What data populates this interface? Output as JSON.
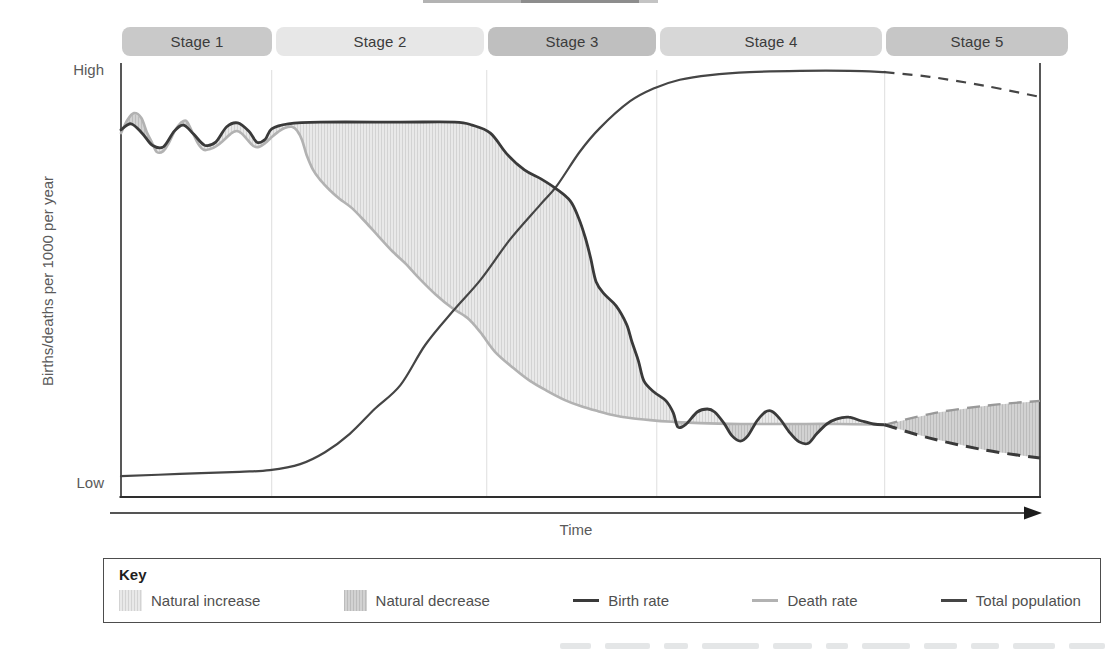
{
  "axes": {
    "y_title": "Births/deaths per 1000 per year",
    "y_high": "High",
    "y_low": "Low",
    "x_title": "Time"
  },
  "key": {
    "title": "Key",
    "items": [
      {
        "label": "Natural increase",
        "swatch": "increase"
      },
      {
        "label": "Natural decrease",
        "swatch": "decrease"
      },
      {
        "label": "Birth rate",
        "swatch": "line",
        "color": "#3a3a3a"
      },
      {
        "label": "Death rate",
        "swatch": "line",
        "color": "#b2b2b2"
      },
      {
        "label": "Total population",
        "swatch": "line",
        "color": "#454545"
      }
    ]
  },
  "colors": {
    "birth": "#3a3a3a",
    "death": "#b2b2b2",
    "death_projected": "#999999",
    "population": "#454545",
    "increase_fill": "#e9e9e9",
    "increase_line": "#d3d3d3",
    "decrease_fill": "#d2d2d2",
    "decrease_line": "#bcbcbc",
    "axis": "#2e2e2e",
    "divider": "#dedede",
    "arrow": "#1c1c1c"
  },
  "chart_data": {
    "type": "line",
    "xlabel": "Time",
    "ylabel": "Births/deaths per 1000 per year",
    "x_range": [
      0,
      100
    ],
    "y_range": [
      0,
      100
    ],
    "y_tick_labels": [
      "Low",
      "High"
    ],
    "grid": false,
    "legend_position": "bottom-box",
    "stages": [
      {
        "label": "Stage 1",
        "t0": 0.1,
        "t1": 16.4,
        "color": "#c9c9c9"
      },
      {
        "label": "Stage 2",
        "t0": 16.9,
        "t1": 39.5,
        "color": "#e7e7e7"
      },
      {
        "label": "Stage 3",
        "t0": 39.9,
        "t1": 58.2,
        "color": "#bfbfbf"
      },
      {
        "label": "Stage 4",
        "t0": 58.6,
        "t1": 82.8,
        "color": "#d7d7d7"
      },
      {
        "label": "Stage 5",
        "t0": 83.2,
        "t1": 103.0,
        "color": "#c6c6c6"
      }
    ],
    "stage_boundaries": [
      16.4,
      39.8,
      58.3,
      83.1
    ],
    "series": [
      {
        "name": "Birth rate",
        "style": "solid",
        "points": [
          [
            0,
            86
          ],
          [
            1.1,
            87.4
          ],
          [
            2.3,
            85.2
          ],
          [
            3.4,
            82.4
          ],
          [
            4.6,
            82
          ],
          [
            5.8,
            85.7
          ],
          [
            6.8,
            87.1
          ],
          [
            7.9,
            85
          ],
          [
            9.1,
            82.4
          ],
          [
            10.3,
            83.1
          ],
          [
            11.5,
            86.7
          ],
          [
            12.7,
            87.6
          ],
          [
            13.9,
            85.7
          ],
          [
            14.8,
            83.1
          ],
          [
            15.7,
            83.8
          ],
          [
            16.4,
            86.2
          ],
          [
            18.2,
            87.4
          ],
          [
            21.7,
            87.8
          ],
          [
            30.4,
            87.8
          ],
          [
            36.3,
            87.8
          ],
          [
            38.2,
            87.1
          ],
          [
            40.2,
            85.2
          ],
          [
            42,
            80.3
          ],
          [
            43.9,
            76.6
          ],
          [
            45.7,
            74.5
          ],
          [
            47.4,
            72.1
          ],
          [
            48.9,
            69.3
          ],
          [
            49.8,
            65.3
          ],
          [
            50.5,
            60.9
          ],
          [
            51.1,
            56
          ],
          [
            51.7,
            50.4
          ],
          [
            52.6,
            47.5
          ],
          [
            53.9,
            44.7
          ],
          [
            55,
            40.5
          ],
          [
            55.6,
            36.3
          ],
          [
            56.3,
            31.9
          ],
          [
            56.9,
            27.2
          ],
          [
            58,
            24.6
          ],
          [
            59.3,
            22.5
          ],
          [
            60.1,
            19.7
          ],
          [
            60.6,
            16.4
          ],
          [
            61.5,
            17.1
          ],
          [
            62.7,
            19.9
          ],
          [
            63.8,
            20.6
          ],
          [
            64.6,
            19.9
          ],
          [
            65.6,
            17.3
          ],
          [
            66.5,
            14.3
          ],
          [
            67.4,
            13.1
          ],
          [
            68.2,
            14.3
          ],
          [
            69.2,
            17.8
          ],
          [
            70.1,
            19.9
          ],
          [
            70.8,
            20.1
          ],
          [
            71.7,
            18.3
          ],
          [
            72.8,
            15
          ],
          [
            73.8,
            12.9
          ],
          [
            74.8,
            12.6
          ],
          [
            75.7,
            14.8
          ],
          [
            76.8,
            17.1
          ],
          [
            77.9,
            18.3
          ],
          [
            79.2,
            18.7
          ],
          [
            80.6,
            17.8
          ],
          [
            81.9,
            17.1
          ],
          [
            83.1,
            16.9
          ]
        ]
      },
      {
        "name": "Death rate",
        "style": "solid",
        "points": [
          [
            0,
            85.2
          ],
          [
            0.7,
            88.3
          ],
          [
            1.4,
            89.9
          ],
          [
            2.2,
            88.8
          ],
          [
            2.8,
            85.5
          ],
          [
            3.4,
            82.9
          ],
          [
            3.9,
            80.8
          ],
          [
            4.6,
            81
          ],
          [
            5.2,
            82.9
          ],
          [
            5.9,
            85.9
          ],
          [
            6.5,
            87.6
          ],
          [
            7.1,
            88.1
          ],
          [
            7.7,
            85.7
          ],
          [
            8.4,
            82.7
          ],
          [
            9,
            81.3
          ],
          [
            9.7,
            81.5
          ],
          [
            10.4,
            82.2
          ],
          [
            11.2,
            83.6
          ],
          [
            11.9,
            85
          ],
          [
            12.5,
            85.7
          ],
          [
            13.1,
            85.2
          ],
          [
            13.7,
            83.8
          ],
          [
            14.4,
            82.2
          ],
          [
            15,
            82
          ],
          [
            15.7,
            82.9
          ],
          [
            16.3,
            84.1
          ],
          [
            17.1,
            85.5
          ],
          [
            17.8,
            86.4
          ],
          [
            18.6,
            86.7
          ],
          [
            19.2,
            85.7
          ],
          [
            19.7,
            83.6
          ],
          [
            20.2,
            80.1
          ],
          [
            20.9,
            76.6
          ],
          [
            21.7,
            74.2
          ],
          [
            22.7,
            71.9
          ],
          [
            23.8,
            69.8
          ],
          [
            25.1,
            67.7
          ],
          [
            26.6,
            64.4
          ],
          [
            28,
            61.1
          ],
          [
            29.5,
            57.6
          ],
          [
            30.9,
            54.8
          ],
          [
            32.5,
            51.1
          ],
          [
            34.3,
            47.3
          ],
          [
            36,
            44.3
          ],
          [
            37.7,
            41.9
          ],
          [
            39.1,
            38.6
          ],
          [
            40.7,
            34
          ],
          [
            42.7,
            30.2
          ],
          [
            44.5,
            27.2
          ],
          [
            46.4,
            24.8
          ],
          [
            48.3,
            22.7
          ],
          [
            50,
            21.3
          ],
          [
            51.9,
            20.1
          ],
          [
            53.5,
            19.2
          ],
          [
            55.4,
            18.5
          ],
          [
            57.6,
            18
          ],
          [
            60,
            17.6
          ],
          [
            63,
            17.3
          ],
          [
            67.4,
            17.1
          ],
          [
            72.8,
            17.1
          ],
          [
            78.2,
            17.1
          ],
          [
            83.1,
            16.9
          ]
        ]
      },
      {
        "name": "Total population",
        "style": "solid",
        "points": [
          [
            0,
            4.9
          ],
          [
            6.4,
            5.4
          ],
          [
            12.9,
            5.9
          ],
          [
            16.2,
            6.3
          ],
          [
            19.5,
            7.7
          ],
          [
            22.2,
            10.5
          ],
          [
            24.9,
            14.8
          ],
          [
            27.6,
            20.6
          ],
          [
            30.4,
            26.2
          ],
          [
            33.1,
            35.6
          ],
          [
            36.1,
            43.5
          ],
          [
            39.1,
            50.8
          ],
          [
            42.3,
            60.2
          ],
          [
            45.6,
            68.4
          ],
          [
            47.4,
            72.8
          ],
          [
            49.9,
            80.8
          ],
          [
            52.1,
            86.4
          ],
          [
            55.4,
            92.7
          ],
          [
            58.1,
            95.8
          ],
          [
            60.8,
            97.7
          ],
          [
            64.1,
            98.8
          ],
          [
            68.4,
            99.5
          ],
          [
            73.9,
            99.8
          ],
          [
            79.3,
            99.8
          ],
          [
            83.1,
            99.5
          ]
        ]
      },
      {
        "name": "Birth rate (projected)",
        "style": "dashed",
        "points": [
          [
            83.1,
            16.9
          ],
          [
            88,
            13.8
          ],
          [
            94,
            11
          ],
          [
            100,
            9.1
          ]
        ]
      },
      {
        "name": "Death rate (projected)",
        "style": "dashed",
        "points": [
          [
            83.1,
            16.9
          ],
          [
            88.6,
            19.7
          ],
          [
            94.6,
            21.5
          ],
          [
            100,
            22.5
          ]
        ]
      },
      {
        "name": "Total population (projected)",
        "style": "dashed",
        "points": [
          [
            83.1,
            99.5
          ],
          [
            88,
            98.4
          ],
          [
            94,
            96.3
          ],
          [
            100,
            93.7
          ]
        ]
      }
    ],
    "shaded_regions": [
      {
        "name": "Natural increase",
        "where": "birth rate above death rate",
        "fill": "light hatch"
      },
      {
        "name": "Natural decrease",
        "where": "death rate above birth rate",
        "fill": "dark hatch"
      }
    ]
  }
}
